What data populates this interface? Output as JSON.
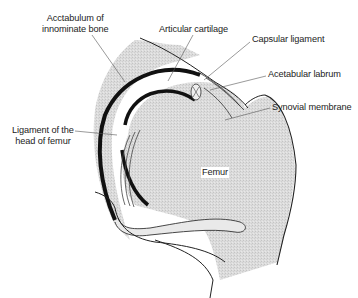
{
  "diagram": {
    "labels": {
      "acetabulum_line1": "Acctabulum of",
      "acetabulum_line2": "innominate bone",
      "articular_cartilage": "Articular cartilage",
      "capsular_ligament": "Capsular ligament",
      "acetabular_labrum": "Acetabular labrum",
      "synovial_membrane": "Synovial membrane",
      "ligament_head_line1": "Ligament of the",
      "ligament_head_line2": "head of femur",
      "femur": "Femur"
    },
    "colors": {
      "bone_fill": "#d9d9d9",
      "cartilage": "#111111",
      "outline": "#222222",
      "leader_line": "#555555",
      "background": "#ffffff"
    }
  }
}
